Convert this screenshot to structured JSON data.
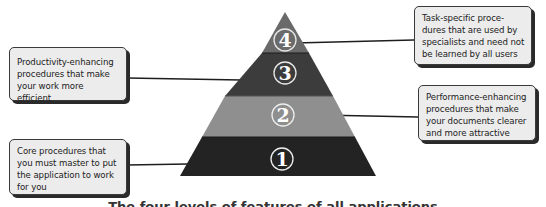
{
  "diagram": {
    "type": "pyramid",
    "tiers": [
      {
        "level": 1,
        "label": "1",
        "color": "#232323",
        "description": "Core procedures that you must master to put the application to work for you"
      },
      {
        "level": 2,
        "label": "2",
        "color": "#8f8f8f",
        "description": "Performance-enhancing procedures that make your documents clearer and more attractive"
      },
      {
        "level": 3,
        "label": "3",
        "color": "#3c3c3c",
        "description": "Productivity-enhancing procedures that make your work more efficient"
      },
      {
        "level": 4,
        "label": "4",
        "color": "#6a6a6a",
        "description": "Task-specific procedures that are used by specialists and need not be learned by all users"
      }
    ],
    "callouts": {
      "task": {
        "lines": [
          "Task-specific proce-",
          "dures that are used by",
          "specialists and need not",
          "be learned by all users"
        ]
      },
      "productivity": {
        "lines": [
          "Productivity-enhancing",
          "procedures that make",
          "your work more efficient"
        ]
      },
      "performance": {
        "lines": [
          "Performance-enhancing",
          "procedures that make",
          "your documents clearer",
          "and more attractive"
        ]
      },
      "core": {
        "lines": [
          "Core procedures that",
          "you must master to put",
          "the application to work",
          "for you"
        ]
      }
    },
    "caption": "The four levels of features of all applications"
  }
}
